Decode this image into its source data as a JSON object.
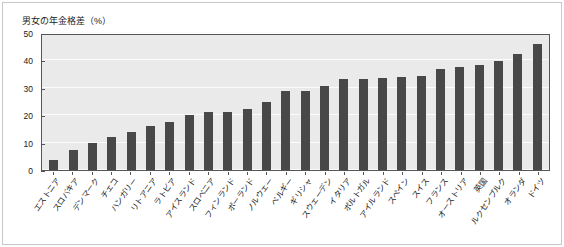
{
  "chart_data": {
    "type": "bar",
    "title": "男女の年金格差（%）",
    "xlabel": "",
    "ylabel": "",
    "ylim": [
      0,
      50
    ],
    "yticks": [
      0,
      10,
      20,
      30,
      40,
      50
    ],
    "grid": true,
    "legend": null,
    "bar_color": "#484848",
    "plot_background": "#eaeaea",
    "categories": [
      "エストニア",
      "スロバキア",
      "デンマーク",
      "チェコ",
      "ハンガリー",
      "リトアニア",
      "ラトビア",
      "アイスランド",
      "スロベニア",
      "フィンランド",
      "ポーランド",
      "ノルウェー",
      "ベルギー",
      "ギリシャ",
      "スウェーデン",
      "イタリア",
      "ポルトガル",
      "アイルランド",
      "スペイン",
      "スイス",
      "フランス",
      "オーストリア",
      "英国",
      "ルクセンブルク",
      "オランダ",
      "ドイツ"
    ],
    "values": [
      3.5,
      7.3,
      10.0,
      12.2,
      14.0,
      16.2,
      17.5,
      20.0,
      21.0,
      21.3,
      22.3,
      25.0,
      28.7,
      28.9,
      30.7,
      33.2,
      33.3,
      33.7,
      33.9,
      34.4,
      37.0,
      37.5,
      38.2,
      39.7,
      42.4,
      46.1
    ]
  }
}
